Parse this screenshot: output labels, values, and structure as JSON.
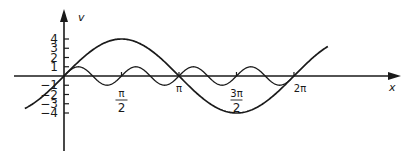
{
  "chart_data": {
    "type": "line",
    "title": "",
    "xlabel": "x",
    "ylabel": "v",
    "x_ticks": [
      {
        "value": 1.5708,
        "label_num": "π",
        "label_den": "2"
      },
      {
        "value": 3.1416,
        "label_num": "π",
        "label_den": ""
      },
      {
        "value": 4.7124,
        "label_num": "3π",
        "label_den": "2"
      },
      {
        "value": 6.2832,
        "label_num": "2π",
        "label_den": ""
      }
    ],
    "y_ticks": [
      4,
      3,
      2,
      1,
      0,
      -1,
      -2,
      -3,
      -4
    ],
    "y_tick_labels": [
      "4",
      "3",
      "2",
      "1",
      "",
      "−1",
      "−2",
      "−3",
      "−4"
    ],
    "xlim": [
      -1.07,
      7.21
    ],
    "ylim": [
      -4,
      4
    ],
    "grid": false,
    "legend": null,
    "series": [
      {
        "name": "v = 4 sin x",
        "function": "4*sin(x)",
        "amplitude": 4,
        "period": 6.2832,
        "x_range": [
          -1.07,
          7.21
        ],
        "x": [
          -1.07,
          0,
          0.785,
          1.571,
          2.356,
          3.142,
          3.927,
          4.712,
          5.498,
          6.283,
          7.21
        ],
        "values": [
          -3.5,
          0,
          2.83,
          4,
          2.83,
          0,
          -2.83,
          -4,
          -2.83,
          0,
          3.18
        ]
      },
      {
        "name": "v = sin 4x",
        "function": "sin(4*x)",
        "amplitude": 1,
        "period": 1.5708,
        "x_range": [
          0,
          6.2
        ],
        "x": [
          0,
          0.393,
          0.785,
          1.178,
          1.571,
          1.963,
          2.356,
          2.749,
          3.142,
          3.534,
          3.927,
          4.32,
          4.712,
          5.105,
          5.498,
          5.89,
          6.2
        ],
        "values": [
          0,
          1,
          0,
          -1,
          0,
          1,
          0,
          -1,
          0,
          1,
          0,
          -1,
          0,
          1,
          0,
          -1,
          -0.32
        ]
      }
    ]
  },
  "axes": {
    "x_label": "x",
    "y_label": "v"
  },
  "style": {
    "line_color": "#1a1a1a",
    "background": "#ffffff"
  }
}
